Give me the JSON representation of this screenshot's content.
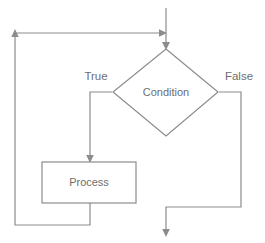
{
  "diagram": {
    "type": "flowchart",
    "background_color": "#ffffff",
    "line_color": "#8c8c8c",
    "text_color": "#6e6e6e",
    "nodes": [
      {
        "id": "condition",
        "shape": "diamond",
        "label": "Condition"
      },
      {
        "id": "process",
        "shape": "rectangle",
        "label": "Process"
      }
    ],
    "edge_labels": [
      {
        "id": "true-branch",
        "label": "True"
      },
      {
        "id": "false-branch",
        "label": "False"
      }
    ],
    "edges": [
      {
        "id": "entry",
        "from": "start",
        "to": "condition",
        "label": ""
      },
      {
        "id": "condition-true",
        "from": "condition",
        "to": "process",
        "label": "True"
      },
      {
        "id": "condition-false",
        "from": "condition",
        "to": "exit",
        "label": "False"
      },
      {
        "id": "process-loopback",
        "from": "process",
        "to": "entry",
        "label": ""
      }
    ]
  }
}
